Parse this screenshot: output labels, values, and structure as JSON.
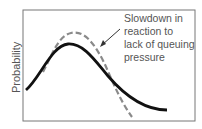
{
  "diagram": {
    "y_axis_label": "Probability",
    "annotation": {
      "lines": [
        "Slowdown in",
        "reaction to",
        "lack of queuing",
        "pressure"
      ]
    },
    "curves": [
      {
        "name": "baseline-distribution",
        "style": "solid",
        "color": "#111111"
      },
      {
        "name": "slowdown-distribution",
        "style": "dashed",
        "color": "#8a8a8a"
      }
    ],
    "frame_color": "#777777"
  }
}
